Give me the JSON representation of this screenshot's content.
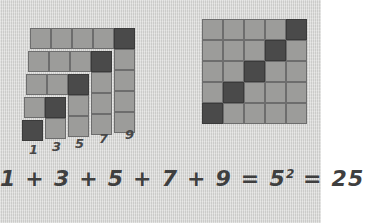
{
  "figure": {
    "background_color": "#d6d6d4",
    "light_tile_color": "#9c9c9a",
    "dark_tile_color": "#4a4a4a",
    "tile_border_color": "#6d6d6d",
    "cell_size_px": 21
  },
  "chart_data": {
    "type": "diagram",
    "title": "1 + 3 + 5 + 7 + 9 = 5² = 25",
    "categories": [
      "1",
      "3",
      "5",
      "7",
      "9"
    ],
    "values": [
      1,
      3,
      5,
      7,
      9
    ],
    "total": 25,
    "square_root": 5,
    "xlabel": "",
    "ylabel": "",
    "legend": []
  },
  "left_figure": {
    "name": "staircase-of-gnomons",
    "gnomons": [
      {
        "label": "1",
        "count": 1,
        "index": 0
      },
      {
        "label": "3",
        "count": 3,
        "index": 1
      },
      {
        "label": "5",
        "count": 5,
        "index": 2
      },
      {
        "label": "7",
        "count": 7,
        "index": 3
      },
      {
        "label": "9",
        "count": 9,
        "index": 4
      }
    ],
    "labels": [
      {
        "text": "1",
        "left": 29,
        "top": 143
      },
      {
        "text": "3",
        "left": 52,
        "top": 140
      },
      {
        "text": "5",
        "left": 75,
        "top": 137
      },
      {
        "text": "7",
        "left": 99,
        "top": 132
      },
      {
        "text": "9",
        "left": 125,
        "top": 128
      }
    ]
  },
  "right_figure": {
    "name": "five-by-five-square",
    "rows": 5,
    "cols": 5,
    "dark_cells_description": "anti-diagonal from bottom-left to top-right",
    "grid": [
      [
        "light",
        "light",
        "light",
        "light",
        "dark"
      ],
      [
        "light",
        "light",
        "light",
        "dark",
        "light"
      ],
      [
        "light",
        "light",
        "dark",
        "light",
        "light"
      ],
      [
        "light",
        "dark",
        "light",
        "light",
        "light"
      ],
      [
        "dark",
        "light",
        "light",
        "light",
        "light"
      ]
    ]
  },
  "equation": {
    "terms": [
      "1",
      "3",
      "5",
      "7",
      "9"
    ],
    "plus": "+",
    "equals": "=",
    "base": "5",
    "exponent": "2",
    "result": "25",
    "full_text": "1 + 3 + 5 + 7 + 9 = 5² = 25"
  }
}
